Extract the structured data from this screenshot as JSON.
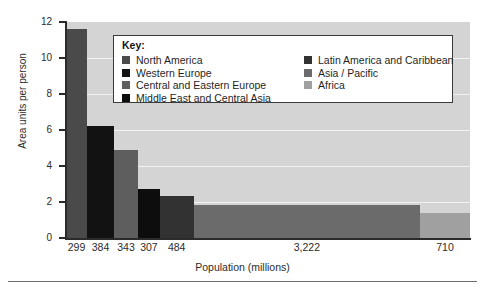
{
  "chart_data": {
    "type": "bar",
    "variant": "marimekko-variable-width",
    "title": "",
    "xlabel": "Population (millions)",
    "ylabel": "Area units per person",
    "ylim": [
      0,
      12
    ],
    "ytick_values": [
      0,
      2,
      4,
      6,
      8,
      10,
      12
    ],
    "ytick_labels": [
      "0",
      "2",
      "4",
      "6",
      "8",
      "10",
      "12"
    ],
    "grid": true,
    "grid_orientation": "horizontal",
    "grid_color": "#f2f2f2",
    "plot_background": "#d4d4d4",
    "legend_position": "inside-top-center",
    "legend_title": "Key:",
    "categories": [
      "North America",
      "Western Europe",
      "Central and Eastern Europe",
      "Middle East and Central Asia",
      "Latin America and Caribbean",
      "Asia / Pacific",
      "Africa"
    ],
    "xtick_labels": [
      "299",
      "384",
      "343",
      "307",
      "484",
      "3,222",
      "710"
    ],
    "widths_population_millions": [
      299,
      384,
      343,
      307,
      484,
      3222,
      710
    ],
    "values": [
      11.6,
      6.25,
      4.9,
      2.7,
      2.35,
      1.85,
      1.4
    ],
    "colors": [
      "#4a4a4a",
      "#121212",
      "#5e5e5e",
      "#0d0d0d",
      "#323232",
      "#6b6b6b",
      "#a0a0a0"
    ],
    "bars": [
      {
        "name": "North America",
        "population": 299,
        "label": "299",
        "value": 11.6,
        "color": "#4a4a4a"
      },
      {
        "name": "Western Europe",
        "population": 384,
        "label": "384",
        "value": 6.25,
        "color": "#121212"
      },
      {
        "name": "Central and Eastern Europe",
        "population": 343,
        "label": "343",
        "value": 4.9,
        "color": "#5e5e5e"
      },
      {
        "name": "Middle East and Central Asia",
        "population": 307,
        "label": "307",
        "value": 2.7,
        "color": "#0d0d0d"
      },
      {
        "name": "Latin America and Caribbean",
        "population": 484,
        "label": "484",
        "value": 2.35,
        "color": "#323232"
      },
      {
        "name": "Asia / Pacific",
        "population": 3222,
        "label": "3,222",
        "value": 1.85,
        "color": "#6b6b6b"
      },
      {
        "name": "Africa",
        "population": 710,
        "label": "710",
        "value": 1.4,
        "color": "#a0a0a0"
      }
    ],
    "legend": {
      "title": "Key:",
      "left_column": [
        {
          "label": "North America",
          "color": "#4a4a4a"
        },
        {
          "label": "Western Europe",
          "color": "#121212"
        },
        {
          "label": "Central and Eastern Europe",
          "color": "#5e5e5e"
        },
        {
          "label": "Middle East and Central Asia",
          "color": "#0d0d0d"
        }
      ],
      "right_column": [
        {
          "label": "Latin America and Caribbean",
          "color": "#323232"
        },
        {
          "label": "Asia / Pacific",
          "color": "#6b6b6b"
        },
        {
          "label": "Africa",
          "color": "#a0a0a0"
        }
      ]
    }
  }
}
